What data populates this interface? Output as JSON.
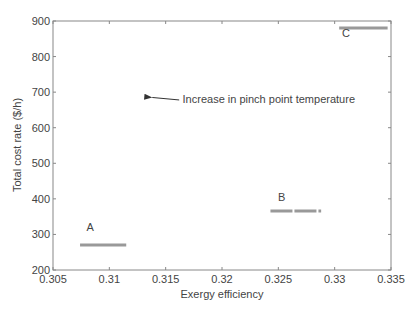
{
  "chart_data": {
    "type": "line",
    "title": "",
    "xlabel": "Exergy efficiency",
    "ylabel": "Total cost rate ($/h)",
    "xlim": [
      0.305,
      0.335
    ],
    "ylim": [
      200,
      900
    ],
    "xticks": [
      0.305,
      0.31,
      0.315,
      0.32,
      0.325,
      0.33,
      0.335
    ],
    "xtick_labels": [
      "0.305",
      "0.31",
      "0.315",
      "0.32",
      "0.325",
      "0.33",
      "0.335"
    ],
    "yticks": [
      200,
      300,
      400,
      500,
      600,
      700,
      800,
      900
    ],
    "ytick_labels": [
      "200",
      "300",
      "400",
      "500",
      "600",
      "700",
      "800",
      "900"
    ],
    "grid": false,
    "legend": null,
    "series": [
      {
        "name": "A",
        "x": [
          0.3074,
          0.3115
        ],
        "y": [
          270,
          270
        ],
        "style": "solid",
        "color": "#999999"
      },
      {
        "name": "B",
        "x": [
          0.3243,
          0.3288
        ],
        "y": [
          366,
          366
        ],
        "style": "dashed",
        "color": "#999999"
      },
      {
        "name": "C",
        "x": [
          0.3304,
          0.3347
        ],
        "y": [
          880,
          880
        ],
        "style": "solid",
        "color": "#999999"
      }
    ],
    "point_labels": [
      {
        "text": "A",
        "x": 0.3083,
        "y": 310
      },
      {
        "text": "B",
        "x": 0.3253,
        "y": 395
      },
      {
        "text": "C",
        "x": 0.331,
        "y": 855
      }
    ],
    "annotations": [
      {
        "text": "Increase in pinch point temperature",
        "text_x": 0.3165,
        "text_y": 680,
        "arrow_from_x": 0.3162,
        "arrow_from_y": 678,
        "arrow_to_x": 0.3131,
        "arrow_to_y": 685
      }
    ]
  }
}
